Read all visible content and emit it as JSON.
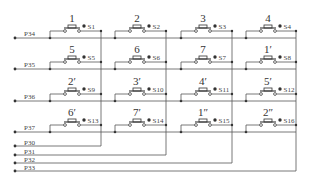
{
  "row_ports": [
    "P34",
    "P35",
    "P36",
    "P37"
  ],
  "col_ports": [
    "P30",
    "P31",
    "P32",
    "P33"
  ],
  "keys": [
    [
      {
        "label": "1",
        "switch": "S1"
      },
      {
        "label": "2",
        "switch": "S2"
      },
      {
        "label": "3",
        "switch": "S3"
      },
      {
        "label": "4",
        "switch": "S4"
      }
    ],
    [
      {
        "label": "5",
        "switch": "S5"
      },
      {
        "label": "6",
        "switch": "S6"
      },
      {
        "label": "7",
        "switch": "S7"
      },
      {
        "label": "1′",
        "switch": "S8"
      }
    ],
    [
      {
        "label": "2′",
        "switch": "S9"
      },
      {
        "label": "3′",
        "switch": "S10"
      },
      {
        "label": "4′",
        "switch": "S11"
      },
      {
        "label": "5′",
        "switch": "S12"
      }
    ],
    [
      {
        "label": "6′",
        "switch": "S13"
      },
      {
        "label": "7′",
        "switch": "S14"
      },
      {
        "label": "1″",
        "switch": "S15"
      },
      {
        "label": "2″",
        "switch": "S16"
      }
    ]
  ],
  "colors": {
    "wire": "#555555",
    "text": "#333333",
    "background": "#ffffff"
  }
}
